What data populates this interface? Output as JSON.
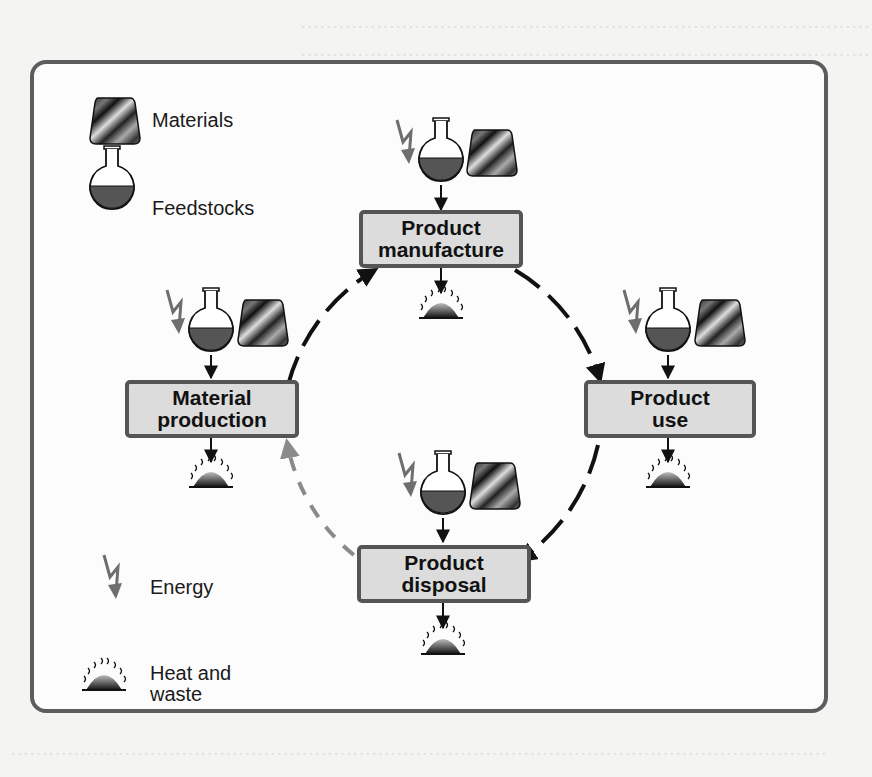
{
  "figure": {
    "title_background": "The material life cycle",
    "stages": [
      {
        "id": "product-manufacture",
        "label": "Product manufacture",
        "line1": "Product",
        "line2": "manufacture"
      },
      {
        "id": "product-use",
        "label": "Product use",
        "line1": "Product",
        "line2": "use"
      },
      {
        "id": "product-disposal",
        "label": "Product disposal",
        "line1": "Product",
        "line2": "disposal"
      },
      {
        "id": "material-production",
        "label": "Material production",
        "line1": "Material",
        "line2": "production"
      }
    ],
    "cycle": [
      {
        "from": "material-production",
        "to": "product-manufacture",
        "style": "solid"
      },
      {
        "from": "product-manufacture",
        "to": "product-use",
        "style": "solid"
      },
      {
        "from": "product-use",
        "to": "product-disposal",
        "style": "solid"
      },
      {
        "from": "product-disposal",
        "to": "material-production",
        "style": "dashed"
      }
    ],
    "stage_inputs": [
      "energy",
      "feedstocks",
      "materials"
    ],
    "stage_outputs": [
      "heat-and-waste"
    ]
  },
  "legend": {
    "materials": "Materials",
    "feedstocks": "Feedstocks",
    "energy": "Energy",
    "heat_line1": "Heat and",
    "heat_line2": "waste"
  },
  "colors": {
    "frame_border": "#5d5d5d",
    "box_fill": "#dcdcdc",
    "box_border": "#555555",
    "arrow": "#111111",
    "dashed_arrow": "#8a8a8a",
    "energy": "#6e6e6e",
    "feedstock_fill": "#555555"
  }
}
